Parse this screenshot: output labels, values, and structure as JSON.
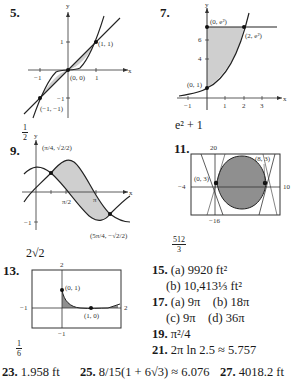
{
  "problems": {
    "p5": {
      "number": "5.",
      "answer_num": "1",
      "answer_den": "2",
      "labels": {
        "y": "y",
        "x": "x",
        "pt1": "(1, 1)",
        "pt0": "(0, 0)",
        "ptm": "(−1, −1)",
        "t1": "1",
        "tm1x": "−1",
        "t1x": "1",
        "tm1y": "−1"
      }
    },
    "p7": {
      "number": "7.",
      "answer": "e² + 1",
      "labels": {
        "y": "y",
        "x": "x",
        "top": "(0, e²)",
        "right": "(2, e²)",
        "bottom": "(0, 1)",
        "y6": "6",
        "y4": "4",
        "xm1": "−1",
        "x1": "1",
        "x2": "2",
        "x3": "3"
      }
    },
    "p9": {
      "number": "9.",
      "answer": "2√2",
      "labels": {
        "y": "y",
        "x": "x",
        "pt1": "(π/4, √2/2)",
        "pt2": "(5π/4, −√2/2)",
        "halfpi": "π/2",
        "pi": "π",
        "m1": "−1"
      }
    },
    "p11": {
      "number": "11.",
      "answer_num": "512",
      "answer_den": "3",
      "labels": {
        "ymax": "20",
        "ymin": "−16",
        "xmin": "−4",
        "xmax": "10",
        "ptL": "(0, 3)",
        "ptR": "(8, 3)"
      }
    },
    "p13": {
      "number": "13.",
      "answer_num": "1",
      "answer_den": "6",
      "labels": {
        "ymax": "2",
        "ymin": "−1",
        "xmin": "−1",
        "xmax": "2",
        "pt1": "(0, 1)",
        "pt2": "(1, 0)"
      }
    },
    "p15": {
      "number": "15.",
      "a": "(a) 9920 ft²",
      "b": "(b) 10,413⅓ ft²"
    },
    "p17": {
      "number": "17.",
      "a": "(a) 9π",
      "b": "(b) 18π",
      "c": "(c) 9π",
      "d": "(d) 36π"
    },
    "p19": {
      "number": "19.",
      "answer": "π²/4"
    },
    "p21": {
      "number": "21.",
      "answer": "2π ln 2.5 ≈ 5.757"
    },
    "p23": {
      "number": "23.",
      "answer": "1.958 ft"
    },
    "p25": {
      "number": "25.",
      "answer": "8/15(1 + 6√3) ≈ 6.076"
    },
    "p27": {
      "number": "27.",
      "answer": "4018.2 ft"
    }
  }
}
